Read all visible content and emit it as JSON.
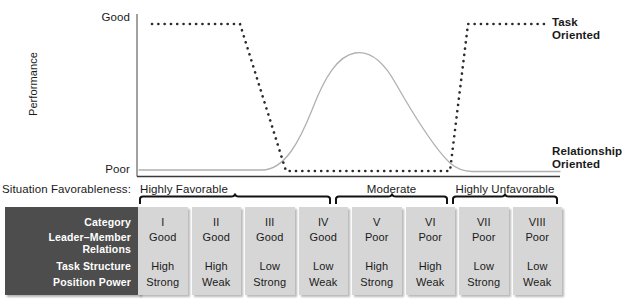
{
  "figure": {
    "y_axis": {
      "title": "Performance",
      "top_tick": "Good",
      "bottom_tick": "Poor"
    },
    "legend": [
      {
        "key": "task",
        "line1": "Task",
        "line2": "Oriented",
        "style": "dotted",
        "color": "#2b2b2b"
      },
      {
        "key": "relationship",
        "line1": "Relationship",
        "line2": "Oriented",
        "style": "solid",
        "color": "#a8a8a8"
      }
    ],
    "favorableness": {
      "label": "Situation Favorableness:",
      "groups": [
        {
          "label": "Highly Favorable",
          "columns": [
            "I",
            "II",
            "III"
          ]
        },
        {
          "label": "Moderate",
          "columns": [
            "IV",
            "V",
            "VI"
          ]
        },
        {
          "label": "Highly Unfavorable",
          "columns": [
            "VII",
            "VIII"
          ]
        }
      ]
    },
    "matrix": {
      "row_labels": {
        "category": "Category",
        "leader_member_relations_line1": "Leader–Member",
        "leader_member_relations_line2": "Relations",
        "task_structure": "Task Structure",
        "position_power": "Position Power"
      },
      "columns": [
        {
          "category": "I",
          "leader_member_relations": "Good",
          "task_structure": "High",
          "position_power": "Strong"
        },
        {
          "category": "II",
          "leader_member_relations": "Good",
          "task_structure": "High",
          "position_power": "Weak"
        },
        {
          "category": "III",
          "leader_member_relations": "Good",
          "task_structure": "Low",
          "position_power": "Strong"
        },
        {
          "category": "IV",
          "leader_member_relations": "Good",
          "task_structure": "Low",
          "position_power": "Weak"
        },
        {
          "category": "V",
          "leader_member_relations": "Poor",
          "task_structure": "High",
          "position_power": "Strong"
        },
        {
          "category": "VI",
          "leader_member_relations": "Poor",
          "task_structure": "High",
          "position_power": "Weak"
        },
        {
          "category": "VII",
          "leader_member_relations": "Poor",
          "task_structure": "Low",
          "position_power": "Strong"
        },
        {
          "category": "VIII",
          "leader_member_relations": "Poor",
          "task_structure": "Low",
          "position_power": "Weak"
        }
      ]
    }
  },
  "chart_data": {
    "type": "line",
    "title": "",
    "xlabel": "Situation Favorableness",
    "ylabel": "Performance",
    "ylim": [
      "Poor",
      "Good"
    ],
    "grid": false,
    "legend_position": "right",
    "categories": [
      "I",
      "II",
      "III",
      "IV",
      "V",
      "VI",
      "VII",
      "VIII"
    ],
    "series": [
      {
        "name": "Task Oriented",
        "style": "dotted",
        "color": "#2b2b2b",
        "values": [
          "Good",
          "Good",
          "Good",
          "Poor",
          "Poor",
          "Poor",
          "Good",
          "Good"
        ],
        "description": "High (Good) performance in categories I–III, drops through category III–IV to low (Poor) across IV–VI, then rises back to high (Good) for VII–VIII."
      },
      {
        "name": "Relationship Oriented",
        "style": "solid",
        "color": "#a8a8a8",
        "values": [
          "Poor",
          "Poor",
          "Poor",
          "Good",
          "Good",
          "Poor",
          "Poor",
          "Poor"
        ],
        "description": "Low (Poor) performance in categories I–III, rises to a peak near the middle (categories IV–V), then falls back to low (Poor) by categories VII–VIII."
      }
    ]
  }
}
